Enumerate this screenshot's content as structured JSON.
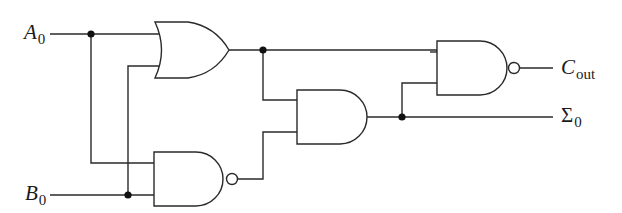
{
  "diagram": {
    "title": "",
    "type": "logic-circuit",
    "colors": {
      "stroke": "#2a2a2a",
      "background": "#ffffff",
      "junction": "#111111"
    },
    "inputs": [
      {
        "id": "A0",
        "name": "A",
        "subscript": "0",
        "y": 34
      },
      {
        "id": "B0",
        "name": "B",
        "subscript": "0",
        "y": 195
      }
    ],
    "outputs": [
      {
        "id": "Cout",
        "name": "C",
        "subscript": "out",
        "y": 69
      },
      {
        "id": "Sigma0",
        "name": "Σ",
        "subscript": "0",
        "y": 117
      }
    ],
    "gates": [
      {
        "id": "or1",
        "type": "OR",
        "inputs": [
          "A0",
          "B0"
        ]
      },
      {
        "id": "nand1",
        "type": "NAND",
        "inputs": [
          "A0",
          "B0"
        ]
      },
      {
        "id": "and1",
        "type": "AND",
        "inputs": [
          "or1",
          "nand1"
        ],
        "output": "Sigma0"
      },
      {
        "id": "nand2",
        "type": "NAND",
        "inputs": [
          "or1",
          "and1"
        ],
        "output": "Cout"
      }
    ],
    "junctions": [
      {
        "x": 91,
        "y": 34
      },
      {
        "x": 128,
        "y": 195
      },
      {
        "x": 263,
        "y": 50
      },
      {
        "x": 402,
        "y": 117
      }
    ]
  }
}
